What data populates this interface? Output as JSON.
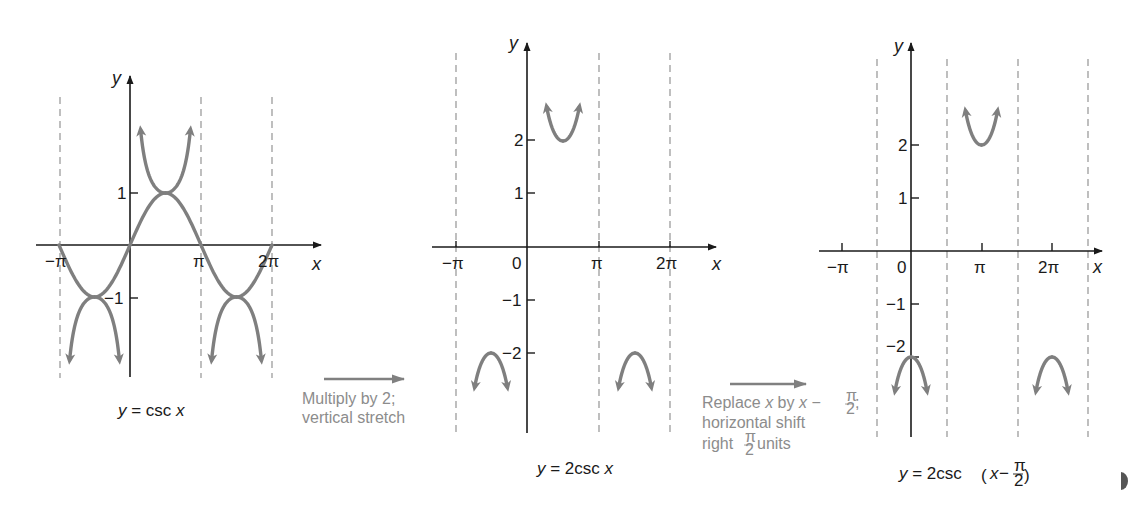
{
  "colors": {
    "axis": "#1a1a1a",
    "curve": "#7f7f7f",
    "asymptote": "#8a8a8a",
    "note_text": "#8c8c8c"
  },
  "transitions": [
    {
      "lines": [
        "Multiply by 2;",
        "vertical stretch"
      ]
    },
    {
      "lines": [
        "Replace x by x − π/2;",
        "horizontal shift",
        "right π/2 units"
      ]
    }
  ],
  "chart_data": [
    {
      "type": "line",
      "title": "y = csc x",
      "function": "csc(x)",
      "reference_function": "sin(x)",
      "xlabel": "x",
      "ylabel": "y",
      "x_ticks": [
        "−π",
        "π",
        "2π"
      ],
      "y_ticks": [
        "1",
        "−1"
      ],
      "asymptotes": [
        "−π",
        "π",
        "2π"
      ],
      "xlim": [
        "−π",
        "2π"
      ],
      "ylim": [
        -2.5,
        3.2
      ],
      "series": [
        {
          "name": "y = sin x (reference)",
          "points": [
            [
              -3.1416,
              0
            ],
            [
              -1.5708,
              -1
            ],
            [
              0,
              0
            ],
            [
              1.5708,
              1
            ],
            [
              3.1416,
              0
            ],
            [
              4.7124,
              -1
            ],
            [
              6.2832,
              0
            ]
          ]
        },
        {
          "name": "y = csc x",
          "local_extrema": [
            [
              -1.5708,
              -1
            ],
            [
              1.5708,
              1
            ],
            [
              4.7124,
              -1
            ]
          ]
        }
      ]
    },
    {
      "type": "line",
      "title": "y = 2csc x",
      "function": "2csc(x)",
      "xlabel": "x",
      "ylabel": "y",
      "x_ticks": [
        "−π",
        "0",
        "π",
        "2π"
      ],
      "y_ticks": [
        "2",
        "1",
        "−1",
        "−2"
      ],
      "asymptotes": [
        "−π",
        "π",
        "2π"
      ],
      "ylim": [
        -3.5,
        3.8
      ],
      "series": [
        {
          "name": "y = 2csc x",
          "local_extrema": [
            [
              -1.5708,
              -2
            ],
            [
              1.5708,
              2
            ],
            [
              4.7124,
              -2
            ]
          ]
        }
      ]
    },
    {
      "type": "line",
      "title": "y = 2csc(x − π/2)",
      "function": "2csc(x - pi/2)",
      "xlabel": "x",
      "ylabel": "y",
      "x_ticks": [
        "−π",
        "0",
        "π",
        "2π"
      ],
      "y_ticks": [
        "2",
        "1",
        "−1",
        "−2"
      ],
      "asymptotes": [
        "−π/2",
        "π/2",
        "3π/2",
        "5π/2"
      ],
      "ylim": [
        -3.5,
        3.8
      ],
      "series": [
        {
          "name": "y = 2csc(x − π/2)",
          "local_extrema": [
            [
              0,
              -2
            ],
            [
              3.1416,
              2
            ],
            [
              6.2832,
              -2
            ]
          ]
        }
      ]
    }
  ],
  "labels": {
    "g1": {
      "y": "y",
      "x": "x",
      "xt": [
        "−π",
        "π",
        "2π"
      ],
      "yt": [
        "1",
        "−1"
      ],
      "cap_pre": "y",
      "cap_mid": " = csc ",
      "cap_post": "x"
    },
    "g2": {
      "y": "y",
      "x": "x",
      "xt": [
        "−π",
        "0",
        "π",
        "2π"
      ],
      "yt": [
        "2",
        "1",
        "−1",
        "−2"
      ],
      "cap_pre": "y",
      "cap_mid": " = 2csc ",
      "cap_post": "x"
    },
    "g3": {
      "y": "y",
      "x": "x",
      "xt": [
        "−π",
        "0",
        "π",
        "2π"
      ],
      "yt": [
        "2",
        "1",
        "−1",
        "−2"
      ],
      "cap_pre": "y",
      "cap_mid": " = 2csc",
      "cap_paren_l": "(",
      "cap_x": "x",
      "cap_minus": " − ",
      "cap_pi": "π",
      "cap_two": "2",
      "cap_paren_r": ")"
    },
    "t1": {
      "l1": "Multiply by 2;",
      "l2": "vertical stretch"
    },
    "t2": {
      "l1_a": "Replace ",
      "l1_x": "x",
      "l1_b": " by ",
      "l1_x2": "x",
      "l1_c": " − ",
      "l1_pi": "π",
      "l1_two": "2",
      "l1_semi": ";",
      "l2": "horizontal shift",
      "l3_a": "right ",
      "l3_pi": "π",
      "l3_two": "2",
      "l3_b": " units"
    }
  }
}
